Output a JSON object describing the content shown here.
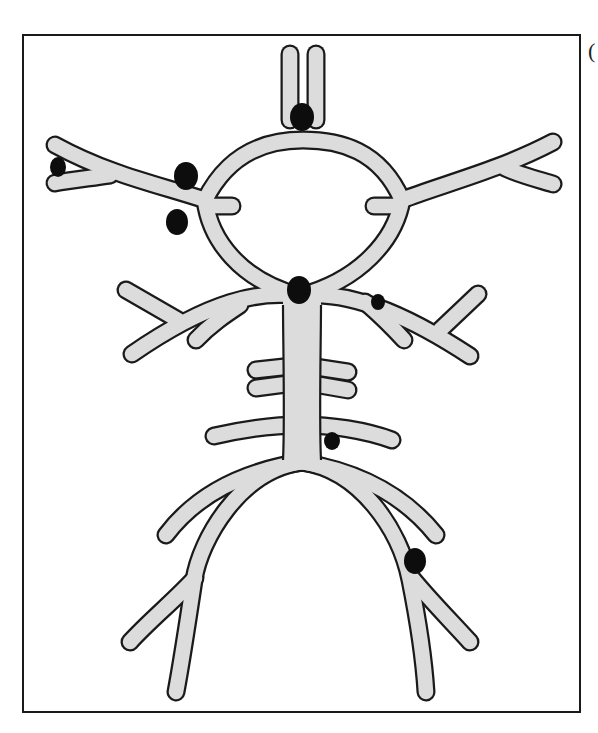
{
  "figure": {
    "title": "",
    "corner_label": "(",
    "colors": {
      "vessel_fill": "#dcdcdc",
      "vessel_outline": "#1a1a1a",
      "aneurysm": "#0d0d0d",
      "frame": "#1a1a1a",
      "background": "#ffffff"
    },
    "aneurysm_count": 9,
    "aneurysms": [
      {
        "site": "anterior-communicating",
        "x": 302,
        "y": 117,
        "r": 13
      },
      {
        "site": "left-mca-distal-bifurcation",
        "x": 58,
        "y": 167,
        "r": 9
      },
      {
        "site": "left-mca-proximal",
        "x": 185,
        "y": 175,
        "r": 13
      },
      {
        "site": "left-ica-pcom",
        "x": 177,
        "y": 222,
        "r": 12
      },
      {
        "site": "basilar-tip",
        "x": 299,
        "y": 290,
        "r": 13
      },
      {
        "site": "right-pcom-sca",
        "x": 377,
        "y": 300,
        "r": 7
      },
      {
        "site": "basilar-trunk-aica",
        "x": 331,
        "y": 441,
        "r": 8
      },
      {
        "site": "right-vertebral-pica",
        "x": 415,
        "y": 561,
        "r": 12
      }
    ]
  }
}
